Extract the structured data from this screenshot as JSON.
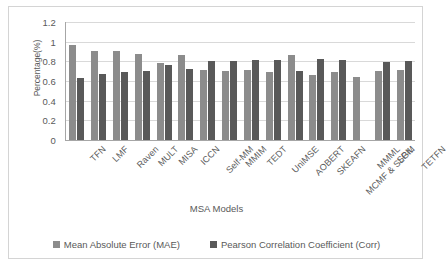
{
  "chart_data": {
    "type": "bar",
    "title": "",
    "xlabel": "MSA Models",
    "ylabel": "Percentage(%)",
    "ylim": [
      0,
      1.2
    ],
    "ytick_labels": [
      "1.2",
      "1",
      "0.8",
      "0.6",
      "0.4",
      "0.2",
      "0"
    ],
    "yticks": [
      1.2,
      1,
      0.8,
      0.6,
      0.4,
      0.2,
      0
    ],
    "grid": true,
    "legend_position": "bottom",
    "categories": [
      "TFN",
      "LMF",
      "Raven",
      "MULT",
      "MISA",
      "ICCN",
      "Self-MM",
      "MMIM",
      "TEDT",
      "UniMSE",
      "AOBERT",
      "SKEAFN",
      "MCMF & SLGM",
      "MMML",
      "SPIL",
      "TETFN"
    ],
    "series": [
      {
        "name": "Mean Absolute Error (MAE)",
        "color": "#8c8c8c",
        "values": [
          0.97,
          0.91,
          0.91,
          0.87,
          0.78,
          0.86,
          0.71,
          0.7,
          0.71,
          0.69,
          0.86,
          0.66,
          0.69,
          0.64,
          0.7,
          0.71
        ]
      },
      {
        "name": "Pearson Correlation Coefficient (Corr)",
        "color": "#595959",
        "values": [
          0.63,
          0.67,
          0.69,
          0.7,
          0.76,
          0.72,
          0.8,
          0.8,
          0.81,
          0.81,
          0.7,
          0.82,
          0.81,
          null,
          0.79,
          0.8
        ]
      }
    ]
  }
}
